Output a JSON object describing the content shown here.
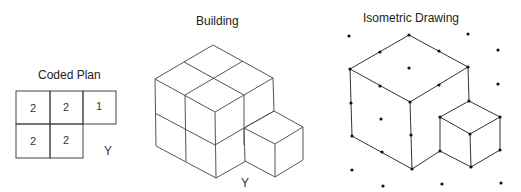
{
  "panels": {
    "coded_plan": {
      "title": "Coded Plan",
      "cells": [
        {
          "row": 0,
          "col": 0,
          "value": "2"
        },
        {
          "row": 0,
          "col": 1,
          "value": "2"
        },
        {
          "row": 0,
          "col": 2,
          "value": "1"
        },
        {
          "row": 1,
          "col": 0,
          "value": "2"
        },
        {
          "row": 1,
          "col": 1,
          "value": "2"
        }
      ],
      "label": "Y"
    },
    "building": {
      "title": "Building",
      "label": "Y"
    },
    "isometric": {
      "title": "Isometric Drawing"
    }
  },
  "colors": {
    "line": "#555555",
    "dot": "#111111",
    "text": "#222222"
  }
}
